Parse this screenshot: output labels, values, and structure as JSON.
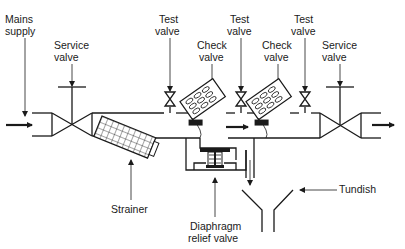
{
  "diagram": {
    "labels": {
      "mains_supply": [
        "Mains",
        "supply"
      ],
      "service_valve_left": [
        "Service",
        "valve"
      ],
      "test_valve_1": [
        "Test",
        "valve"
      ],
      "check_valve_1": [
        "Check",
        "valve"
      ],
      "test_valve_2": [
        "Test",
        "valve"
      ],
      "check_valve_2": [
        "Check",
        "valve"
      ],
      "test_valve_3": [
        "Test",
        "valve"
      ],
      "service_valve_right": [
        "Service",
        "valve"
      ],
      "strainer": [
        "Strainer"
      ],
      "diaphragm_relief_valve": [
        "Diaphragm",
        "relief valve"
      ],
      "tundish": [
        "Tundish"
      ]
    },
    "colors": {
      "line": "#1a1a1a",
      "background": "#ffffff"
    }
  }
}
